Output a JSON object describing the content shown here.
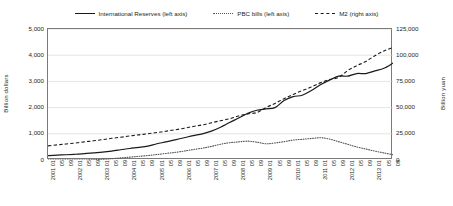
{
  "chart_data": {
    "type": "line",
    "title": "",
    "xlabel": "",
    "ylabel": "Billion dollars",
    "y2label": "Billion yuan",
    "ylim": [
      0,
      5000
    ],
    "y2lim": [
      0,
      125000
    ],
    "grid": true,
    "legend_position": "top-center",
    "y_left_ticks": [
      "0",
      "1,000",
      "2,000",
      "3,000",
      "4,000",
      "5,000"
    ],
    "y_right_ticks": [
      "0",
      "25,000",
      "50,000",
      "75,000",
      "100,000",
      "125,000"
    ],
    "x_tick_labels": [
      "2001 01",
      "05",
      "09",
      "2002 01",
      "05",
      "09",
      "2003 01",
      "05",
      "09",
      "2004 01",
      "05",
      "09",
      "2005 01",
      "05",
      "09",
      "2006 01",
      "05",
      "09",
      "2007 01",
      "05",
      "09",
      "2008 01",
      "05",
      "09",
      "2009 01",
      "05",
      "09",
      "2010 01",
      "05",
      "09",
      "2011 01",
      "05",
      "09",
      "2012 01",
      "05",
      "09",
      "2013 01",
      "05",
      "09"
    ],
    "categories": [
      "2001 01",
      "2001 05",
      "2001 09",
      "2002 01",
      "2002 05",
      "2002 09",
      "2003 01",
      "2003 05",
      "2003 09",
      "2004 01",
      "2004 05",
      "2004 09",
      "2005 01",
      "2005 05",
      "2005 09",
      "2006 01",
      "2006 05",
      "2006 09",
      "2007 01",
      "2007 05",
      "2007 09",
      "2008 01",
      "2008 05",
      "2008 09",
      "2009 01",
      "2009 05",
      "2009 09",
      "2010 01",
      "2010 05",
      "2010 09",
      "2011 01",
      "2011 05",
      "2011 09",
      "2012 01",
      "2012 05",
      "2012 09",
      "2013 01",
      "2013 05",
      "2013 09"
    ],
    "series": [
      {
        "name": "International Reserves (left axis)",
        "axis": "left",
        "style": "solid",
        "color": "#1a1a1a",
        "unit": "Billion dollars",
        "values": [
          170,
          185,
          200,
          220,
          240,
          270,
          300,
          340,
          390,
          440,
          480,
          530,
          620,
          690,
          770,
          850,
          930,
          1000,
          1100,
          1250,
          1430,
          1600,
          1780,
          1900,
          1950,
          2000,
          2270,
          2420,
          2470,
          2650,
          2870,
          3050,
          3200,
          3200,
          3300,
          3300,
          3400,
          3500,
          3700
        ]
      },
      {
        "name": "PBC bills (left axis)",
        "axis": "left",
        "style": "dotted",
        "color": "#555555",
        "unit": "Billion dollars",
        "values": [
          0,
          0,
          0,
          0,
          0,
          10,
          30,
          50,
          80,
          110,
          140,
          170,
          210,
          250,
          290,
          340,
          400,
          450,
          520,
          600,
          660,
          690,
          720,
          680,
          620,
          650,
          700,
          760,
          790,
          820,
          850,
          800,
          700,
          600,
          500,
          420,
          340,
          270,
          200
        ]
      },
      {
        "name": "M2 (right axis)",
        "axis": "right",
        "style": "dashed",
        "color": "#1a1a1a",
        "unit": "Billion yuan",
        "values": [
          13500,
          14400,
          15300,
          16200,
          17300,
          18300,
          19400,
          20700,
          21700,
          22900,
          24000,
          25000,
          26200,
          27500,
          28800,
          30300,
          32000,
          33500,
          35500,
          37500,
          39300,
          42000,
          44000,
          45300,
          50000,
          54000,
          58500,
          62600,
          66300,
          69600,
          73600,
          76800,
          78700,
          85300,
          90000,
          94000,
          99500,
          104000,
          107500
        ]
      }
    ]
  },
  "legend": {
    "entries": [
      {
        "label": "International Reserves (left axis)",
        "style": "solid"
      },
      {
        "label": "PBC bills (left axis)",
        "style": "dotted"
      },
      {
        "label": "M2 (right axis)",
        "style": "dashed"
      }
    ]
  }
}
